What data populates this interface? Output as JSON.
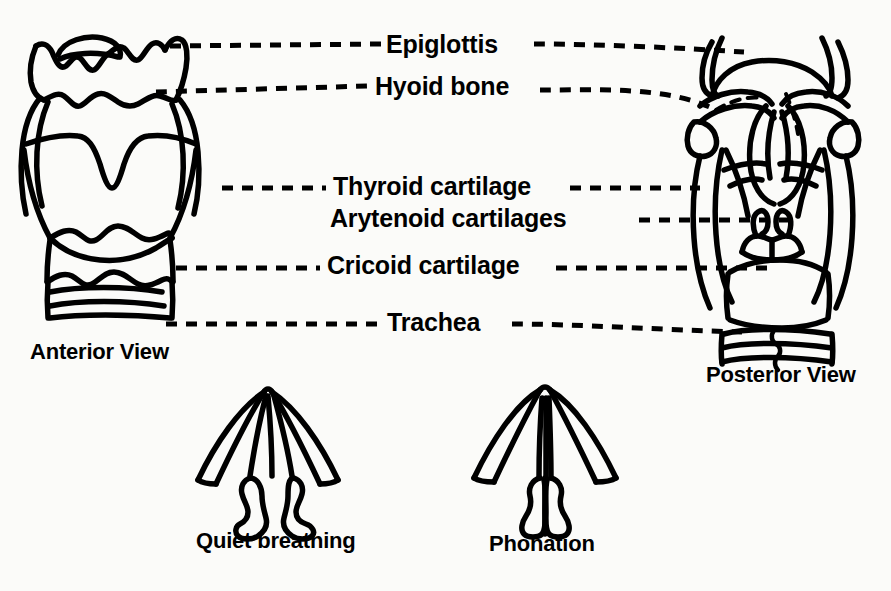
{
  "figure": {
    "background_color": "#fbfbf9",
    "ink_color": "#000000"
  },
  "labels": {
    "epiglottis": "Epiglottis",
    "hyoid_bone": "Hyoid bone",
    "thyroid_cartilage": "Thyroid cartilage",
    "arytenoid_cartilages": "Arytenoid cartilages",
    "cricoid_cartilage": "Cricoid cartilage",
    "trachea": "Trachea"
  },
  "captions": {
    "anterior_view": "Anterior View",
    "posterior_view": "Posterior View",
    "quiet_breathing": "Quiet breathing",
    "phonation": "Phonation"
  },
  "leader_lines": [
    {
      "label": "Epiglottis",
      "side": "left",
      "from_x": 170,
      "to_x": 382,
      "y": 45
    },
    {
      "label": "Epiglottis",
      "side": "right",
      "from_x": 530,
      "to_x": 742,
      "y": 45
    },
    {
      "label": "Hyoid bone",
      "side": "left",
      "from_x": 158,
      "to_x": 370,
      "y": 87
    },
    {
      "label": "Hyoid bone",
      "side": "right",
      "from_x": 545,
      "to_x": 740,
      "y": 87
    },
    {
      "label": "Thyroid cartilage",
      "side": "left",
      "from_x": 222,
      "to_x": 328,
      "y": 188
    },
    {
      "label": "Thyroid cartilage",
      "side": "right",
      "from_x": 568,
      "to_x": 690,
      "y": 188
    },
    {
      "label": "Arytenoid cartilages",
      "side": "right",
      "from_x": 640,
      "to_x": 800,
      "y": 220
    },
    {
      "label": "Cricoid cartilage",
      "side": "left",
      "from_x": 175,
      "to_x": 322,
      "y": 267
    },
    {
      "label": "Cricoid cartilage",
      "side": "right",
      "from_x": 558,
      "to_x": 770,
      "y": 267
    },
    {
      "label": "Trachea",
      "side": "left",
      "from_x": 168,
      "to_x": 382,
      "y": 323
    },
    {
      "label": "Trachea",
      "side": "right",
      "from_x": 518,
      "to_x": 740,
      "y": 323
    }
  ],
  "figures": [
    {
      "name": "anterior-larynx",
      "caption": "Anterior View"
    },
    {
      "name": "posterior-larynx",
      "caption": "Posterior View"
    },
    {
      "name": "vocal-folds-abducted",
      "caption": "Quiet breathing"
    },
    {
      "name": "vocal-folds-adducted",
      "caption": "Phonation"
    }
  ]
}
